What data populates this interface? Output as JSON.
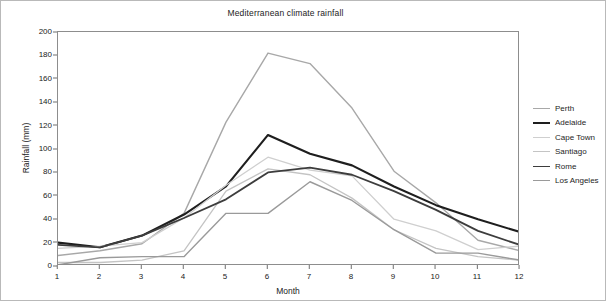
{
  "chart_data": {
    "type": "line",
    "title": "Mediterranean climate rainfall",
    "xlabel": "Month",
    "ylabel": "Rainfall (mm)",
    "xlim": [
      1,
      12
    ],
    "ylim": [
      0,
      200
    ],
    "ytick_step": 20,
    "grid": false,
    "legend_position": "right",
    "x": [
      1,
      2,
      3,
      4,
      5,
      6,
      7,
      8,
      9,
      10,
      11,
      12
    ],
    "xticks": [
      "1",
      "2",
      "3",
      "4",
      "5",
      "6",
      "7",
      "8",
      "9",
      "10",
      "11",
      "12"
    ],
    "yticks": [
      "0",
      "20",
      "40",
      "60",
      "80",
      "100",
      "120",
      "140",
      "160",
      "180",
      "200"
    ],
    "series": [
      {
        "name": "Perth",
        "color": "#a8a8a8",
        "width": 1.4,
        "values": [
          9,
          13,
          19,
          45,
          123,
          182,
          173,
          135,
          81,
          54,
          22,
          13
        ]
      },
      {
        "name": "Adelaide",
        "color": "#1e1e1e",
        "width": 2.1,
        "values": [
          20,
          16,
          26,
          44,
          68,
          112,
          96,
          86,
          68,
          52,
          40,
          29
        ]
      },
      {
        "name": "Cape Town",
        "color": "#cfcfcf",
        "width": 1.3,
        "values": [
          15,
          17,
          20,
          41,
          69,
          93,
          82,
          77,
          40,
          30,
          14,
          17
        ]
      },
      {
        "name": "Santiago",
        "color": "#c4c4c4",
        "width": 1.3,
        "values": [
          3,
          3,
          5,
          13,
          64,
          83,
          78,
          58,
          31,
          15,
          8,
          5
        ]
      },
      {
        "name": "Rome",
        "color": "#3d3d3d",
        "width": 1.8,
        "values": [
          18,
          16,
          26,
          41,
          57,
          80,
          84,
          78,
          64,
          48,
          30,
          18
        ]
      },
      {
        "name": "Los Angeles",
        "color": "#9a9a9a",
        "width": 1.4,
        "values": [
          1,
          7,
          8,
          8,
          45,
          45,
          72,
          56,
          31,
          11,
          11,
          5
        ]
      }
    ]
  }
}
